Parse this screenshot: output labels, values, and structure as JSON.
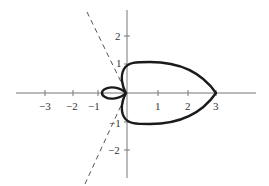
{
  "figure": {
    "type": "polar-curve-plot",
    "origin_px": [
      126,
      93
    ],
    "unit_px": 29.5,
    "colors": {
      "axis": "#777777",
      "curve": "#1a1a1a",
      "tangent": "#555555",
      "label": "#333333"
    },
    "x_axis": {
      "ticks": [
        {
          "value": -3,
          "label": "−3"
        },
        {
          "value": -2,
          "label": "−2"
        },
        {
          "value": -1,
          "label": "−1"
        },
        {
          "value": 1,
          "label": "1"
        },
        {
          "value": 2,
          "label": "2"
        },
        {
          "value": 3,
          "label": "3"
        }
      ]
    },
    "y_axis": {
      "ticks": [
        {
          "value": 2,
          "label": "2"
        },
        {
          "value": 1,
          "label": "1"
        },
        {
          "value": -1,
          "label": "−1"
        },
        {
          "value": -2,
          "label": "−2"
        }
      ]
    },
    "curve": {
      "description": "Solid closed curve: outer loop from origin to a point at x=3 (heart/teardrop shape, flat top near y=1), plus a small inner loop on the left reaching x=-1",
      "outer_extent_x": 3,
      "outer_extent_y": 1,
      "inner_loop_extent_x": -1
    },
    "tangent_lines": {
      "description": "Dashed lines through the origin, tangent to curve at the pole",
      "angles_deg": [
        116,
        244
      ]
    }
  }
}
